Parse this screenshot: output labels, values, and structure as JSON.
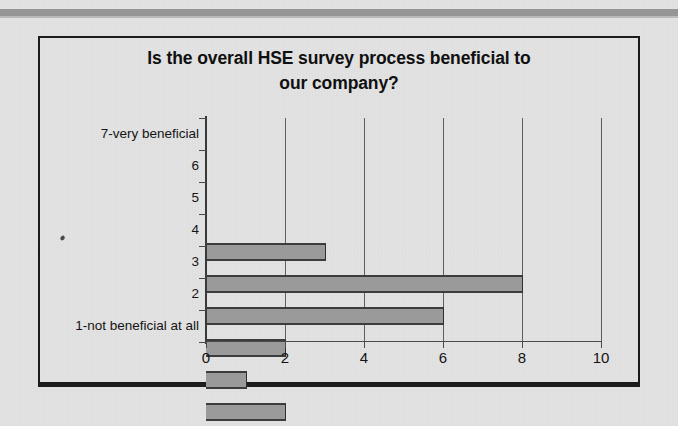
{
  "chart_data": {
    "type": "bar",
    "orientation": "horizontal",
    "title": "Is the overall HSE survey process beneficial to our company?",
    "title_line1": "Is the overall HSE survey process beneficial to",
    "title_line2": "our company?",
    "xlabel": "",
    "ylabel": "",
    "categories": [
      "7-very beneficial",
      "6",
      "5",
      "4",
      "3",
      "2",
      "1-not beneficial at all"
    ],
    "values": [
      3,
      8,
      6,
      2,
      1,
      2,
      0
    ],
    "xlim": [
      0,
      10
    ],
    "xticks": [
      0,
      2,
      4,
      6,
      8,
      10
    ],
    "xtick_labels": [
      "0",
      "2",
      "4",
      "6",
      "8",
      "10"
    ],
    "grid": "vertical",
    "legend": "none",
    "bar_color": "#9a9a9a",
    "bar_edge_color": "#3c3c3c",
    "plot_background": "#e3e3e3",
    "axis_color": "#4a4a4a",
    "frame_color": "#1b1b1b"
  }
}
